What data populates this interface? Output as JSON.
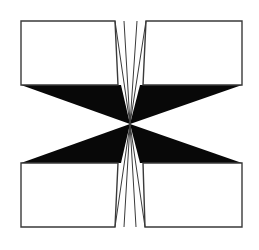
{
  "figure": {
    "canvas": {
      "width": 259,
      "height": 250,
      "background_color": "#ffffff"
    },
    "colors": {
      "background": "#ffffff",
      "ink": "#000000",
      "outline": "#3a3a3a",
      "panel_fill": "#ffffff",
      "wedge_fill": "#080808"
    },
    "geometry": {
      "center_x": 130,
      "center_y": 124,
      "left_edge": 21,
      "right_edge": 242,
      "top_edge": 21,
      "bottom_edge": 227,
      "upper_band_y": 85,
      "lower_band_y": 163,
      "top_gap_left_x": 115,
      "top_gap_right_x": 146,
      "bottom_gap_left_x": 115,
      "bottom_gap_right_x": 145,
      "outline_width": 1.4,
      "hairline_width": 1.0
    },
    "panels": [
      {
        "name": "top-left-panel",
        "points": "21,21 115,21 118,85 21,85",
        "fill": "#ffffff",
        "stroke": "#3a3a3a"
      },
      {
        "name": "top-right-panel",
        "points": "146,21 242,21 242,85 143,85",
        "fill": "#ffffff",
        "stroke": "#3a3a3a"
      },
      {
        "name": "bottom-left-panel",
        "points": "21,163 118,163 115,227 21,227",
        "fill": "#ffffff",
        "stroke": "#3a3a3a"
      },
      {
        "name": "bottom-right-panel",
        "points": "143,163 242,163 242,227 145,227",
        "fill": "#ffffff",
        "stroke": "#3a3a3a"
      }
    ],
    "wedges": [
      {
        "name": "upper-left-wedge",
        "points": "21,85 121,85 130,124",
        "fill": "#080808"
      },
      {
        "name": "upper-right-wedge",
        "points": "140,85 242,85 130,124",
        "fill": "#080808"
      },
      {
        "name": "lower-left-wedge",
        "points": "21,163 121,163 130,124",
        "fill": "#080808"
      },
      {
        "name": "lower-right-wedge",
        "points": "140,163 242,163 130,124",
        "fill": "#080808"
      }
    ],
    "hairlines": [
      {
        "name": "top-left-outer-hairline",
        "x1": 115,
        "y1": 21,
        "x2": 130,
        "y2": 124
      },
      {
        "name": "top-left-inner-hairline",
        "x1": 124,
        "y1": 21,
        "x2": 130,
        "y2": 124
      },
      {
        "name": "top-right-inner-hairline",
        "x1": 137,
        "y1": 21,
        "x2": 130,
        "y2": 124
      },
      {
        "name": "top-right-outer-hairline",
        "x1": 146,
        "y1": 21,
        "x2": 130,
        "y2": 124
      },
      {
        "name": "bottom-left-outer-hairline",
        "x1": 115,
        "y1": 227,
        "x2": 130,
        "y2": 124
      },
      {
        "name": "bottom-left-inner-hairline",
        "x1": 124,
        "y1": 227,
        "x2": 130,
        "y2": 124
      },
      {
        "name": "bottom-right-inner-hairline",
        "x1": 136,
        "y1": 227,
        "x2": 130,
        "y2": 124
      },
      {
        "name": "bottom-right-outer-hairline",
        "x1": 145,
        "y1": 227,
        "x2": 130,
        "y2": 124
      }
    ]
  }
}
